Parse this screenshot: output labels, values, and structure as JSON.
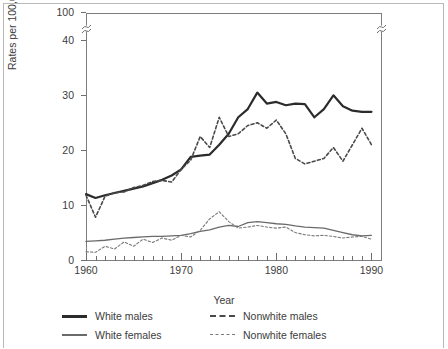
{
  "axes": {
    "ylabel": "Rates per 100,000 population",
    "xlabel": "Year",
    "ytick_labels": [
      "0",
      "10",
      "20",
      "30",
      "40",
      "100"
    ],
    "ytick_values": [
      0,
      10,
      20,
      30,
      40,
      100
    ],
    "xtick_labels": [
      "1960",
      "1970",
      "1980",
      "1990"
    ],
    "xtick_values": [
      1960,
      1970,
      1980,
      1990
    ],
    "axis_break": "break-symbol"
  },
  "legend": {
    "rows": [
      {
        "left": {
          "label": "White males",
          "style": "thick-solid"
        },
        "right": {
          "label": "Nonwhite males",
          "style": "thick-dash"
        }
      },
      {
        "left": {
          "label": "White females",
          "style": "thin-solid"
        },
        "right": {
          "label": "Nonwhite females",
          "style": "thin-dash"
        }
      }
    ]
  },
  "colors": {
    "white_males": "#2b2b2b",
    "nonwhite_males": "#4a4a4a",
    "white_females": "#6a6a6a",
    "nonwhite_females": "#7a7a7a",
    "grid": "#dedede",
    "frame": "#7d7d7d",
    "page_border": "#b9b9b9"
  },
  "chart_data": {
    "type": "line",
    "title": "",
    "xlabel": "Year",
    "ylabel": "Rates per 100,000 population",
    "xlim": [
      1960,
      1991
    ],
    "ylim": [
      0,
      45
    ],
    "y_axis_break": {
      "from": 45,
      "to": 100,
      "note": "axis compressed above 40; top of axis labelled 100"
    },
    "grid": true,
    "grid_interval": 5,
    "legend_position": "below",
    "x": [
      1960,
      1961,
      1962,
      1963,
      1964,
      1965,
      1966,
      1967,
      1968,
      1969,
      1970,
      1971,
      1972,
      1973,
      1974,
      1975,
      1976,
      1977,
      1978,
      1979,
      1980,
      1981,
      1982,
      1983,
      1984,
      1985,
      1986,
      1987,
      1988,
      1989,
      1990
    ],
    "series": [
      {
        "name": "White males",
        "style": "thick-solid",
        "color": "#2b2b2b",
        "values": [
          12.0,
          11.3,
          11.8,
          12.2,
          12.6,
          13.0,
          13.4,
          14.0,
          14.6,
          15.4,
          16.5,
          18.8,
          19.0,
          19.2,
          21.0,
          23.0,
          26.0,
          27.5,
          30.5,
          28.5,
          28.8,
          28.2,
          28.5,
          28.4,
          26.0,
          27.5,
          30.0,
          28.0,
          27.2,
          27.0,
          27.0
        ]
      },
      {
        "name": "Nonwhite males",
        "style": "thick-dash",
        "color": "#4a4a4a",
        "values": [
          11.8,
          7.8,
          11.6,
          12.3,
          12.4,
          13.2,
          13.6,
          14.3,
          14.5,
          14.2,
          16.5,
          18.2,
          22.5,
          20.5,
          26.0,
          22.5,
          23.0,
          24.5,
          25.0,
          24.0,
          25.5,
          23.0,
          18.5,
          17.5,
          18.0,
          18.5,
          20.5,
          18.0,
          21.0,
          24.0,
          21.0
        ]
      },
      {
        "name": "White females",
        "style": "thin-solid",
        "color": "#6a6a6a",
        "values": [
          3.4,
          3.5,
          3.6,
          3.8,
          4.0,
          4.1,
          4.2,
          4.3,
          4.3,
          4.4,
          4.5,
          4.8,
          5.2,
          5.5,
          6.0,
          6.3,
          6.1,
          6.8,
          7.0,
          6.8,
          6.6,
          6.5,
          6.2,
          6.0,
          5.9,
          5.8,
          5.4,
          5.0,
          4.6,
          4.4,
          4.5
        ]
      },
      {
        "name": "Nonwhite females",
        "style": "thin-dash",
        "color": "#7a7a7a",
        "values": [
          1.5,
          1.4,
          2.5,
          2.0,
          3.3,
          2.5,
          3.8,
          3.2,
          4.0,
          3.6,
          4.5,
          4.2,
          5.4,
          7.5,
          8.8,
          7.0,
          5.8,
          6.0,
          6.3,
          6.0,
          5.8,
          6.0,
          5.0,
          4.6,
          4.4,
          4.5,
          4.3,
          4.0,
          4.2,
          4.3,
          3.8
        ]
      }
    ]
  }
}
